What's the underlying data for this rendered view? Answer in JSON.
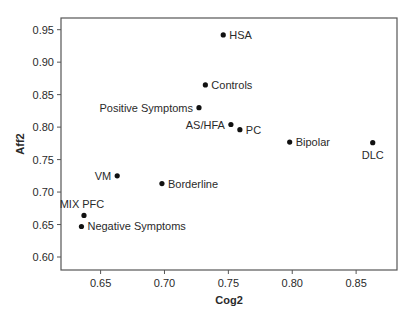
{
  "chart_data": {
    "type": "scatter",
    "title": "",
    "xlabel": "Cog2",
    "ylabel": "Aff2",
    "xlim": [
      0.619,
      0.882
    ],
    "ylim": [
      0.58,
      0.968
    ],
    "xticks": [
      0.65,
      0.7,
      0.75,
      0.8,
      0.85
    ],
    "xtick_labels": [
      "0.65",
      "0.70",
      "0.75",
      "0.80",
      "0.85"
    ],
    "yticks": [
      0.6,
      0.65,
      0.7,
      0.75,
      0.8,
      0.85,
      0.9,
      0.95
    ],
    "ytick_labels": [
      "0.60",
      "0.65",
      "0.70",
      "0.75",
      "0.80",
      "0.85",
      "0.90",
      "0.95"
    ],
    "grid": false,
    "legend": null,
    "points": [
      {
        "label": "HSA",
        "x": 0.746,
        "y": 0.942,
        "label_pos": "right"
      },
      {
        "label": "Controls",
        "x": 0.732,
        "y": 0.865,
        "label_pos": "right"
      },
      {
        "label": "Positive Symptoms",
        "x": 0.727,
        "y": 0.83,
        "label_pos": "left"
      },
      {
        "label": "AS/HFA",
        "x": 0.752,
        "y": 0.804,
        "label_pos": "left"
      },
      {
        "label": "PC",
        "x": 0.759,
        "y": 0.796,
        "label_pos": "right"
      },
      {
        "label": "Bipolar",
        "x": 0.798,
        "y": 0.777,
        "label_pos": "right"
      },
      {
        "label": "DLC",
        "x": 0.863,
        "y": 0.776,
        "label_pos": "below"
      },
      {
        "label": "VM",
        "x": 0.663,
        "y": 0.725,
        "label_pos": "left"
      },
      {
        "label": "Borderline",
        "x": 0.698,
        "y": 0.713,
        "label_pos": "right"
      },
      {
        "label": "MIX PFC",
        "x": 0.637,
        "y": 0.664,
        "label_pos": "above"
      },
      {
        "label": "Negative Symptoms",
        "x": 0.635,
        "y": 0.647,
        "label_pos": "right"
      }
    ],
    "colors": {
      "marker": "#111111",
      "axis": "#555555",
      "text": "#2a2a2a"
    }
  }
}
